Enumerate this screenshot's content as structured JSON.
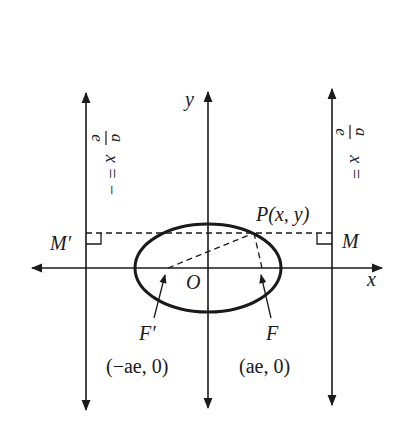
{
  "diagram": {
    "colors": {
      "ink": "#1a1a1a",
      "background": "#ffffff"
    },
    "axes": {
      "x_label": "x",
      "y_label": "y",
      "origin_label": "O"
    },
    "directrices": {
      "left_label": "x = −a/e",
      "left_lhs": "x = −",
      "right_label": "x = a/e",
      "right_lhs": "x =",
      "numerator": "a",
      "denominator": "e"
    },
    "points": {
      "P": {
        "label": "P(x, y)"
      },
      "M": {
        "label": "M"
      },
      "M_prime": {
        "label": "M′"
      },
      "F": {
        "label": "F",
        "coords": "(ae, 0)"
      },
      "F_prime": {
        "label": "F′",
        "coords": "(−ae, 0)"
      }
    }
  }
}
